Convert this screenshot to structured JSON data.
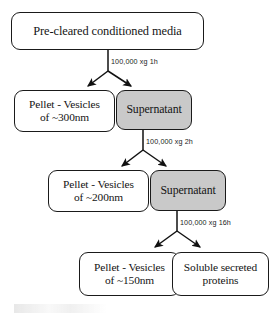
{
  "diagram": {
    "background_color": "#ffffff",
    "box_border_color": "#1a1a1a",
    "supernatant_fill_color": "#c9c9c9",
    "pellet_fill_color": "#ffffff",
    "nodes": [
      {
        "id": "start",
        "label": "Pre-cleared conditioned media",
        "type": "source",
        "fill": "#ffffff"
      },
      {
        "id": "pellet300",
        "label_line1": "Pellet - Vesicles",
        "label_line2": "of ~300nm",
        "type": "pellet",
        "fill": "#ffffff"
      },
      {
        "id": "sup1",
        "label": "Supernatant",
        "type": "supernatant",
        "fill": "#c9c9c9"
      },
      {
        "id": "pellet200",
        "label_line1": "Pellet - Vesicles",
        "label_line2": "of ~200nm",
        "type": "pellet",
        "fill": "#ffffff"
      },
      {
        "id": "sup2",
        "label": "Supernatant",
        "type": "supernatant",
        "fill": "#c9c9c9"
      },
      {
        "id": "pellet150",
        "label_line1": "Pellet - Vesicles",
        "label_line2": "of ~150nm",
        "type": "pellet",
        "fill": "#ffffff"
      },
      {
        "id": "soluble",
        "label_line1": "Soluble secreted",
        "label_line2": "proteins",
        "type": "product",
        "fill": "#ffffff"
      }
    ],
    "edge_labels": [
      {
        "id": "spin1",
        "text": "100,000 xg 1h"
      },
      {
        "id": "spin2",
        "text": "100,000 xg 2h"
      },
      {
        "id": "spin3",
        "text": "100,000 xg 16h"
      }
    ]
  }
}
